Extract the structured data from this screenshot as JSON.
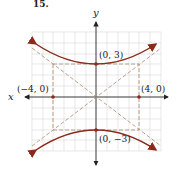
{
  "problem_number": "15.",
  "axes": {
    "x_label": "x",
    "y_label": "y"
  },
  "points": [
    {
      "label": "(0, 3)",
      "x": 0,
      "y": 3
    },
    {
      "label": "(0, −3)",
      "x": 0,
      "y": -3
    },
    {
      "label": "(−4, 0)",
      "x": -4,
      "y": 0
    },
    {
      "label": "(4, 0)",
      "x": 4,
      "y": 0
    }
  ],
  "curve": {
    "type": "hyperbola",
    "equation": "y^2/9 - x^2/16 = 1",
    "color": "#8b2a1a"
  },
  "asymptotes": [
    "y = 3x/4",
    "y = -3x/4"
  ],
  "colors": {
    "curve": "#8b2a1a",
    "dashed": "#b08a70",
    "grid": "#d8d8d8",
    "axis": "#222222"
  }
}
